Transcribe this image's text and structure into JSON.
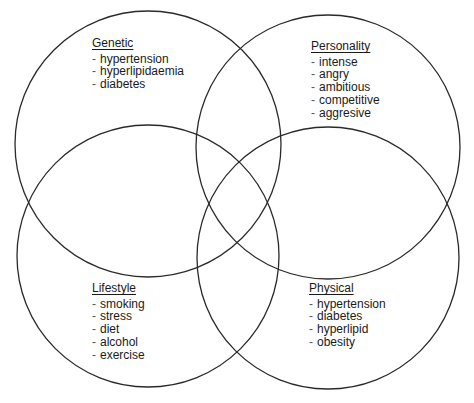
{
  "diagram": {
    "type": "venn",
    "stroke_color": "#2a2a2a",
    "background": "#ffffff",
    "circles": [
      {
        "name": "Genetic",
        "cx": 148,
        "cy": 144,
        "r": 133
      },
      {
        "name": "Personality",
        "cx": 328,
        "cy": 147,
        "r": 132
      },
      {
        "name": "Lifestyle",
        "cx": 148,
        "cy": 256,
        "r": 131
      },
      {
        "name": "Physical",
        "cx": 328,
        "cy": 258,
        "r": 131
      }
    ]
  },
  "sets": {
    "genetic": {
      "title": "Genetic",
      "items": [
        "hypertension",
        "hyperlipidaemia",
        "diabetes"
      ]
    },
    "personality": {
      "title": "Personality",
      "items": [
        "intense",
        "angry",
        "ambitious",
        "competitive",
        "aggresive"
      ]
    },
    "lifestyle": {
      "title": "Lifestyle",
      "items": [
        "smoking",
        "stress",
        "diet",
        "alcohol",
        "exercise"
      ]
    },
    "physical": {
      "title": "Physical",
      "items": [
        "hypertension",
        "diabetes",
        "hyperlipid",
        "obesity"
      ]
    }
  },
  "bullet": "-"
}
